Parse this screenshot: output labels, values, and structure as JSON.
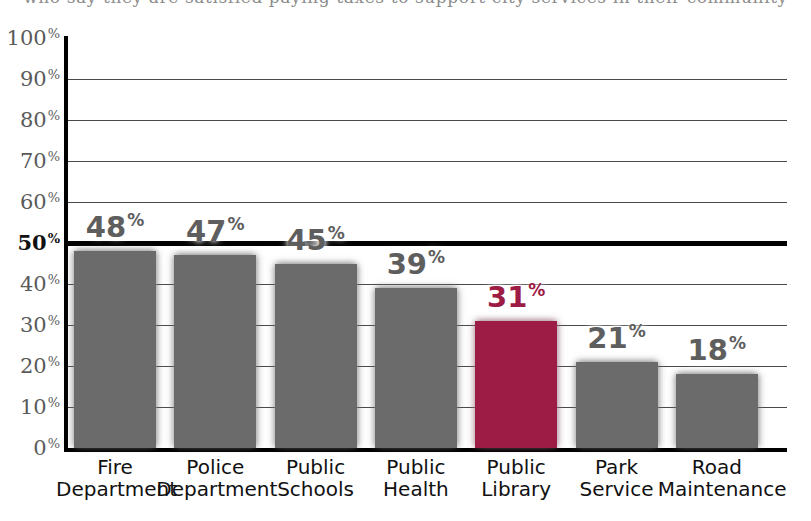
{
  "cutoff_text": "who say they are satisfied paying taxes to support city services in their community",
  "chart_data": {
    "type": "bar",
    "title": "",
    "subtitle": "",
    "xlabel": "",
    "ylabel": "",
    "ylim": [
      0,
      100
    ],
    "grid": true,
    "legend": "none",
    "value_suffix": "%",
    "highlight_color": "#9d1c46",
    "bar_color": "#6b6b6b",
    "reference_line": {
      "value": 50,
      "label": "50%",
      "bold": true
    },
    "categories": [
      "Fire Department",
      "Police Department",
      "Public Schools",
      "Public Health",
      "Public Library",
      "Park Service",
      "Road Maintenance"
    ],
    "category_lines": [
      [
        "Fire",
        "Department"
      ],
      [
        "Police",
        "Department"
      ],
      [
        "Public",
        "Schools"
      ],
      [
        "Public",
        "Health"
      ],
      [
        "Public",
        "Library"
      ],
      [
        "Park",
        "Service"
      ],
      [
        "Road",
        "Maintenance"
      ]
    ],
    "values": [
      48,
      47,
      45,
      39,
      31,
      21,
      18
    ],
    "value_labels": [
      "48",
      "47",
      "45",
      "39",
      "31",
      "21",
      "18"
    ],
    "highlight_index": 4,
    "yticks": [
      100,
      90,
      80,
      70,
      60,
      50,
      40,
      30,
      20,
      10,
      0
    ],
    "ytick_labels": [
      "100",
      "90",
      "80",
      "70",
      "60",
      "50",
      "40",
      "30",
      "20",
      "10",
      "0"
    ]
  }
}
